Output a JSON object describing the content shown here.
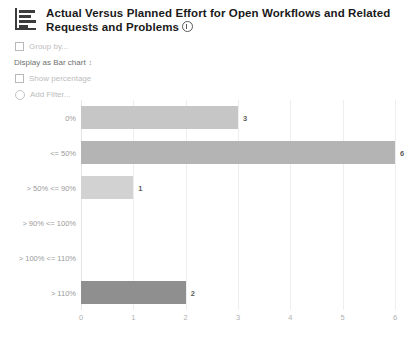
{
  "header": {
    "icon": "bar-chart-icon",
    "title": "Actual Versus Planned Effort for Open Workflows and Related Requests and Problems",
    "info_icon": "info-icon"
  },
  "controls": {
    "group_by": {
      "label": "Group by...",
      "checked": false,
      "control": "checkbox"
    },
    "display_as": {
      "prefix": "Display as",
      "value": "Bar chart",
      "stepper_icon": "up-down-arrows-icon"
    },
    "show_percentage": {
      "label": "Show percentage",
      "checked": false,
      "control": "checkbox"
    },
    "add_filter": {
      "label": "Add Filter...",
      "control": "radio"
    }
  },
  "chart_data": {
    "type": "bar",
    "orientation": "horizontal",
    "title": "Actual Versus Planned Effort for Open Workflows and Related Requests and Problems",
    "xlabel": "",
    "ylabel": "",
    "categories": [
      "0%",
      "<= 50%",
      "> 50% <= 90%",
      "> 90% <= 100%",
      "> 100% <= 110%",
      "> 110%"
    ],
    "values": [
      3,
      6,
      1,
      0,
      0,
      2
    ],
    "value_labels": [
      "3",
      "6",
      "1",
      "",
      "",
      "2"
    ],
    "colors": [
      "#c6c6c6",
      "#b4b4b4",
      "#d2d2d2",
      "#c6c6c6",
      "#c6c6c6",
      "#8f8f8f"
    ],
    "xlim": [
      0,
      6
    ],
    "xticks": [
      0,
      1,
      2,
      3,
      4,
      5,
      6
    ],
    "xtick_labels": [
      "0",
      "1",
      "2",
      "3",
      "4",
      "5",
      "6"
    ],
    "grid": "vertical",
    "legend": "none"
  },
  "palette": {
    "grid": "#eceff1",
    "axis_text": "#b0b0b0",
    "category_text": "#9a9a9a",
    "value_text": "#5d5d5d",
    "title_text": "#1a1a1a",
    "muted_control": "#bdbdbd"
  }
}
